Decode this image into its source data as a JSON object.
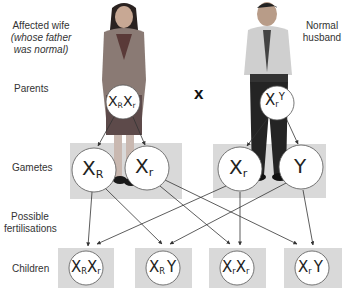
{
  "title_labels": {
    "wife_title": "Affected wife",
    "wife_sub_line1": "(whose father",
    "wife_sub_line2": "was normal)",
    "husband_line1": "Normal",
    "husband_line2": "husband"
  },
  "row_labels": {
    "parents": "Parents",
    "gametes": "Gametes",
    "fert_line1": "Possible",
    "fert_line2": "fertilisations",
    "children": "Children"
  },
  "cross_symbol": "x",
  "parents": {
    "wife": {
      "genotype": "XRXr",
      "chromosomes": [
        {
          "base": "X",
          "sub": "R"
        },
        {
          "base": "X",
          "sub": "r"
        }
      ]
    },
    "husband": {
      "genotype": "XrY",
      "chromosomes": [
        {
          "base": "X",
          "sub": "r"
        },
        {
          "base": "Y",
          "sub": ""
        }
      ]
    }
  },
  "gametes": [
    {
      "base": "X",
      "sub": "R",
      "from": "wife"
    },
    {
      "base": "X",
      "sub": "r",
      "from": "wife"
    },
    {
      "base": "X",
      "sub": "r",
      "from": "husband"
    },
    {
      "base": "Y",
      "sub": "",
      "from": "husband"
    }
  ],
  "children": [
    {
      "genotype": "XRXr",
      "parts": [
        {
          "base": "X",
          "sub": "R"
        },
        {
          "base": "X",
          "sub": "r"
        }
      ]
    },
    {
      "genotype": "XRY",
      "parts": [
        {
          "base": "X",
          "sub": "R"
        },
        {
          "base": "Y",
          "sub": ""
        }
      ]
    },
    {
      "genotype": "XrXr",
      "parts": [
        {
          "base": "X",
          "sub": "r"
        },
        {
          "base": "X",
          "sub": "r"
        }
      ]
    },
    {
      "genotype": "XrY",
      "parts": [
        {
          "base": "X",
          "sub": "r"
        },
        {
          "base": "Y",
          "sub": ""
        }
      ]
    }
  ],
  "figures": {
    "wife": "woman-photo",
    "husband": "man-photo"
  },
  "colors": {
    "shade": "#d9d9d9",
    "line": "#333333",
    "ink": "#222222"
  }
}
